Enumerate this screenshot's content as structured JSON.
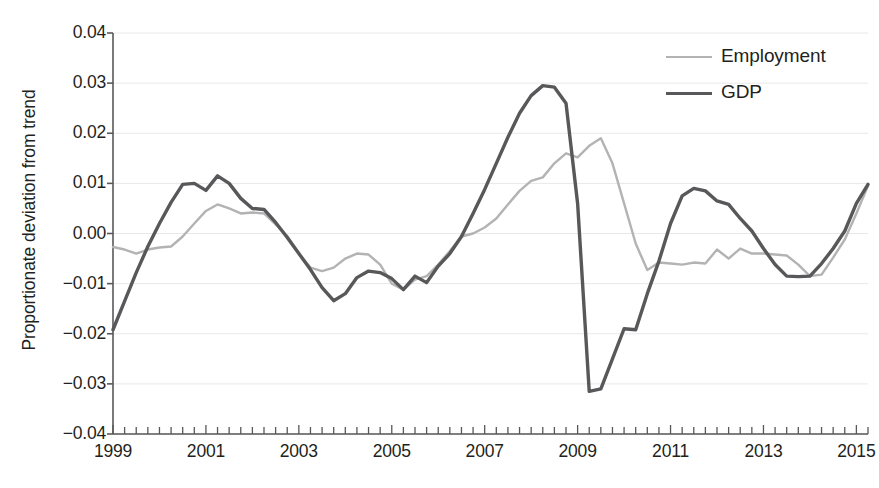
{
  "figure": {
    "clipped_caption_above": "",
    "width": 879,
    "height": 488
  },
  "legend": {
    "position": "top-right",
    "items": [
      {
        "label": "Employment",
        "color": "#b3b3b3",
        "width_px": 2.4,
        "icon": "line-swatch-icon"
      },
      {
        "label": "GDP",
        "color": "#58585a",
        "width_px": 3.4,
        "icon": "line-swatch-icon"
      }
    ]
  },
  "chart_data": {
    "type": "line",
    "title": "",
    "subtitle": "",
    "xlabel": "",
    "ylabel": "Proportionate deviation from trend",
    "xlim": [
      1999.0,
      2015.25
    ],
    "ylim": [
      -0.04,
      0.04
    ],
    "ytick_labels": [
      "0.04",
      "0.03",
      "0.02",
      "0.01",
      "0.00",
      "−0.01",
      "−0.02",
      "−0.03",
      "−0.04"
    ],
    "ytick_values": [
      0.04,
      0.03,
      0.02,
      0.01,
      0.0,
      -0.01,
      -0.02,
      -0.03,
      -0.04
    ],
    "xtick_labels": [
      "1999",
      "2001",
      "2003",
      "2005",
      "2007",
      "2009",
      "2011",
      "2013",
      "2015"
    ],
    "xtick_values": [
      1999,
      2001,
      2003,
      2005,
      2007,
      2009,
      2011,
      2013,
      2015
    ],
    "minor_xtick_interval": 0.25,
    "grid": "horizontal",
    "grid_color": "#e8e8e8",
    "axis_color": "#58585a",
    "x": [
      1999.0,
      1999.25,
      1999.5,
      1999.75,
      2000.0,
      2000.25,
      2000.5,
      2000.75,
      2001.0,
      2001.25,
      2001.5,
      2001.75,
      2002.0,
      2002.25,
      2002.5,
      2002.75,
      2003.0,
      2003.25,
      2003.5,
      2003.75,
      2004.0,
      2004.25,
      2004.5,
      2004.75,
      2005.0,
      2005.25,
      2005.5,
      2005.75,
      2006.0,
      2006.25,
      2006.5,
      2006.75,
      2007.0,
      2007.25,
      2007.5,
      2007.75,
      2008.0,
      2008.25,
      2008.5,
      2008.75,
      2009.0,
      2009.25,
      2009.5,
      2009.75,
      2010.0,
      2010.25,
      2010.5,
      2010.75,
      2011.0,
      2011.25,
      2011.5,
      2011.75,
      2012.0,
      2012.25,
      2012.5,
      2012.75,
      2013.0,
      2013.25,
      2013.5,
      2013.75,
      2014.0,
      2014.25,
      2014.5,
      2014.75,
      2015.0,
      2015.25
    ],
    "series": [
      {
        "name": "GDP",
        "color": "#58585a",
        "width_px": 3.4,
        "values": [
          -0.0192,
          -0.0135,
          -0.0078,
          -0.0026,
          0.002,
          0.0062,
          0.0098,
          0.01,
          0.0086,
          0.0115,
          0.01,
          0.007,
          0.005,
          0.0048,
          0.0022,
          -0.0008,
          -0.004,
          -0.0072,
          -0.0108,
          -0.0134,
          -0.012,
          -0.0088,
          -0.0075,
          -0.0078,
          -0.009,
          -0.0112,
          -0.0085,
          -0.0098,
          -0.0065,
          -0.004,
          -0.0006,
          0.004,
          0.0088,
          0.014,
          0.0192,
          0.024,
          0.0275,
          0.0295,
          0.0292,
          0.026,
          0.006,
          -0.0315,
          -0.031,
          -0.025,
          -0.019,
          -0.0192,
          -0.012,
          -0.0055,
          0.002,
          0.0075,
          0.009,
          0.0085,
          0.0065,
          0.0058,
          0.003,
          0.0005,
          -0.003,
          -0.0062,
          -0.0085,
          -0.0086,
          -0.0085,
          -0.006,
          -0.003,
          0.0005,
          0.006,
          0.0098
        ]
      },
      {
        "name": "Employment",
        "color": "#b3b3b3",
        "width_px": 2.4,
        "values": [
          -0.0027,
          -0.0032,
          -0.004,
          -0.0032,
          -0.0028,
          -0.0026,
          -0.0006,
          0.002,
          0.0045,
          0.0058,
          0.005,
          0.004,
          0.0042,
          0.004,
          0.0018,
          -0.0005,
          -0.004,
          -0.0068,
          -0.0075,
          -0.0068,
          -0.005,
          -0.004,
          -0.0042,
          -0.0062,
          -0.01,
          -0.0112,
          -0.0092,
          -0.0085,
          -0.0062,
          -0.0035,
          -0.0006,
          0.0,
          0.0012,
          0.003,
          0.0058,
          0.0085,
          0.0105,
          0.0112,
          0.014,
          0.016,
          0.0152,
          0.0175,
          0.019,
          0.014,
          0.006,
          -0.002,
          -0.0073,
          -0.0058,
          -0.006,
          -0.0062,
          -0.0058,
          -0.006,
          -0.0032,
          -0.005,
          -0.003,
          -0.004,
          -0.004,
          -0.0042,
          -0.0044,
          -0.0062,
          -0.0085,
          -0.0082,
          -0.0048,
          -0.0012,
          0.004,
          0.0095
        ]
      }
    ],
    "plot_area_px": {
      "left": 113,
      "top": 33,
      "right": 868,
      "bottom": 434
    }
  }
}
